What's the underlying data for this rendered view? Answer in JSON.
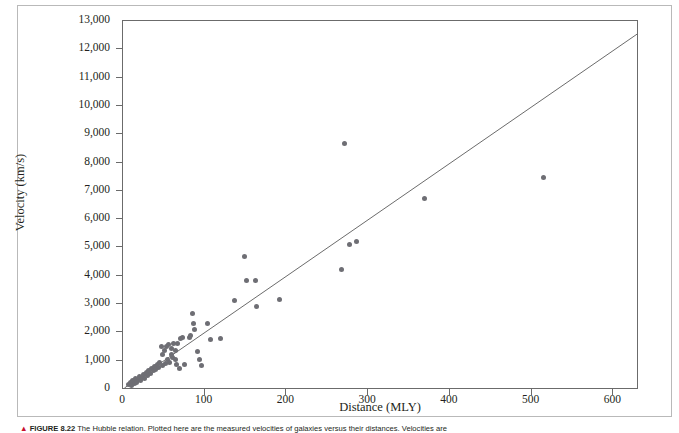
{
  "figure": {
    "caption_marker": "▲",
    "caption_number": "FIGURE 8.22",
    "caption_text": "The Hubble relation. Plotted here are the measured velocities of galaxies versus their distances. Velocities are"
  },
  "chart_data": {
    "type": "scatter",
    "title": "",
    "xlabel": "Distance (MLY)",
    "ylabel": "Velocity (km/s)",
    "xlim": [
      0,
      630
    ],
    "ylim": [
      0,
      13000
    ],
    "xticks": [
      0,
      100,
      200,
      300,
      400,
      500,
      600
    ],
    "xtick_labels": [
      "0",
      "100",
      "200",
      "300",
      "400",
      "500",
      "600"
    ],
    "yticks": [
      0,
      1000,
      2000,
      3000,
      4000,
      5000,
      6000,
      7000,
      8000,
      9000,
      10000,
      11000,
      12000,
      13000
    ],
    "ytick_labels": [
      "0",
      "1,000",
      "2,000",
      "3,000",
      "4,000",
      "5,000",
      "6,000",
      "7,000",
      "8,000",
      "9,000",
      "10,000",
      "11,000",
      "12,000",
      "13,000"
    ],
    "grid": false,
    "legend": null,
    "marker_color": "#6e6e74",
    "line_color": "#5a5a5a",
    "trendline": {
      "type": "line",
      "x": [
        3,
        630
      ],
      "y": [
        0,
        12500
      ],
      "slope_km_s_per_mly": 19.9
    },
    "points": [
      [
        8,
        120
      ],
      [
        10,
        180
      ],
      [
        12,
        95
      ],
      [
        13,
        260
      ],
      [
        15,
        150
      ],
      [
        17,
        320
      ],
      [
        18,
        210
      ],
      [
        20,
        300
      ],
      [
        21,
        420
      ],
      [
        23,
        250
      ],
      [
        25,
        380
      ],
      [
        26,
        490
      ],
      [
        28,
        330
      ],
      [
        30,
        560
      ],
      [
        31,
        430
      ],
      [
        33,
        620
      ],
      [
        35,
        520
      ],
      [
        36,
        700
      ],
      [
        38,
        610
      ],
      [
        40,
        760
      ],
      [
        41,
        660
      ],
      [
        43,
        840
      ],
      [
        45,
        720
      ],
      [
        46,
        900
      ],
      [
        48,
        1480
      ],
      [
        49,
        800
      ],
      [
        50,
        1180
      ],
      [
        52,
        1320
      ],
      [
        53,
        860
      ],
      [
        55,
        1450
      ],
      [
        56,
        1000
      ],
      [
        57,
        1520
      ],
      [
        58,
        900
      ],
      [
        60,
        1400
      ],
      [
        61,
        1200
      ],
      [
        62,
        1060
      ],
      [
        63,
        1560
      ],
      [
        65,
        1010
      ],
      [
        66,
        1330
      ],
      [
        67,
        820
      ],
      [
        68,
        1560
      ],
      [
        70,
        700
      ],
      [
        72,
        1760
      ],
      [
        74,
        1800
      ],
      [
        76,
        840
      ],
      [
        82,
        1800
      ],
      [
        84,
        1840
      ],
      [
        86,
        2620
      ],
      [
        88,
        2280
      ],
      [
        89,
        2080
      ],
      [
        92,
        1280
      ],
      [
        95,
        1020
      ],
      [
        97,
        780
      ],
      [
        104,
        2280
      ],
      [
        108,
        1700
      ],
      [
        121,
        1760
      ],
      [
        138,
        3100
      ],
      [
        150,
        4650
      ],
      [
        152,
        3800
      ],
      [
        163,
        3800
      ],
      [
        165,
        2880
      ],
      [
        193,
        3120
      ],
      [
        268,
        4180
      ],
      [
        272,
        8620
      ],
      [
        278,
        5080
      ],
      [
        287,
        5160
      ],
      [
        370,
        6680
      ],
      [
        516,
        7420
      ]
    ]
  }
}
